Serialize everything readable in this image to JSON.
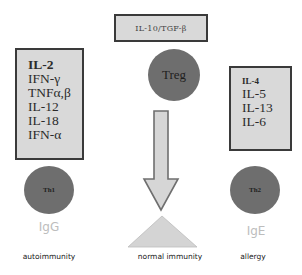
{
  "diagram": {
    "regulator": {
      "cytokines_label": "IL-10/TGF-β",
      "cell_label": "Treg",
      "outcome": "normal immunity"
    },
    "th1": {
      "cytokines": [
        "IL-2",
        "IFN-γ",
        "TNFα,β",
        "IL-12",
        "IL-18",
        "IFN-α"
      ],
      "cell_label": "Th1",
      "antibody": "IgG",
      "outcome": "autoimmunity"
    },
    "th2": {
      "cytokines": [
        "IL-4",
        "IL-5",
        "IL-13",
        "IL-6"
      ],
      "cell_label": "Th2",
      "antibody": "IgE",
      "outcome": "allergy"
    },
    "colors": {
      "box_fill": "#d9d9d9",
      "box_border": "#3a3a3a",
      "cell_fill": "#6e6e6e",
      "arrow_fill": "#d6d6d6",
      "arrow_stroke": "#707070",
      "triangle_fill": "#d4d4d4",
      "antibody_text": "#bdbdbd"
    }
  }
}
